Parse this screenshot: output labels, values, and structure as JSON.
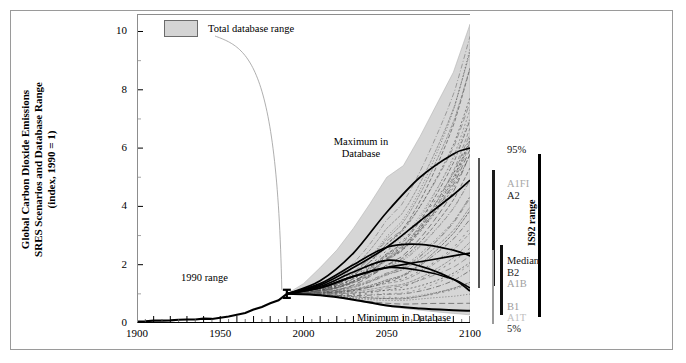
{
  "figure": {
    "ylabel_lines": [
      "Global Carbon Dioxide Emissions",
      "SRES Scenarios and Database Range",
      "(index, 1990 = 1)"
    ],
    "legend_label": "Total database range",
    "legend_swatch_color": "#d4d4d4"
  },
  "annotations": {
    "maximum": "Maximum in\nDatabase",
    "maximum_line1": "Maximum in",
    "maximum_line2": "Database",
    "minimum": "Minimum in Database",
    "range_1990": "1990 range"
  },
  "right_panel": {
    "isq_label": "IS92 range",
    "labels": [
      {
        "text": "95%",
        "color": "#111111",
        "x": 37,
        "y": 130
      },
      {
        "text": "A1FI",
        "color": "#a8a8a8",
        "x": 37,
        "y": 164
      },
      {
        "text": "A2",
        "color": "#222222",
        "x": 37,
        "y": 176
      },
      {
        "text": "Median",
        "color": "#111111",
        "x": 37,
        "y": 241
      },
      {
        "text": "B2",
        "color": "#222222",
        "x": 37,
        "y": 253
      },
      {
        "text": "A1B",
        "color": "#a0a0a0",
        "x": 37,
        "y": 264
      },
      {
        "text": "B1",
        "color": "#9a9a9a",
        "x": 37,
        "y": 287
      },
      {
        "text": "A1T",
        "color": "#c0c0c0",
        "x": 37,
        "y": 298
      },
      {
        "text": "5%",
        "color": "#222222",
        "x": 37,
        "y": 309
      }
    ],
    "bars": [
      {
        "name": "bar-sres-range",
        "x": 8,
        "y_top": 144,
        "y_bottom": 274,
        "color": "#555555",
        "width": 2
      },
      {
        "name": "bar-a1fi-a2",
        "x": 22,
        "y_top": 156,
        "y_bottom": 272,
        "color": "#1a1a1a",
        "width": 2.5
      },
      {
        "name": "bar-median-group",
        "x": 22,
        "y_top": 236,
        "y_bottom": 310,
        "color": "#9a9a9a",
        "width": 2
      },
      {
        "name": "bar-b1-a1t",
        "x": 30,
        "y_top": 231,
        "y_bottom": 301,
        "color": "#111111",
        "width": 2.5
      },
      {
        "name": "bar-is92",
        "x": 68,
        "y_top": 140,
        "y_bottom": 303,
        "color": "#000000",
        "width": 2.5
      }
    ]
  },
  "chart_data": {
    "type": "area",
    "title": "",
    "xlabel": "",
    "ylabel": "Global Carbon Dioxide Emissions SRES Scenarios and Database Range (index, 1990 = 1)",
    "xlim": [
      1900,
      2100
    ],
    "ylim": [
      0,
      10.6
    ],
    "xticks": [
      1900,
      1950,
      2000,
      2050,
      2100
    ],
    "yticks": [
      0,
      2,
      4,
      6,
      8,
      10
    ],
    "yticks_minor": [
      1,
      3,
      5,
      7,
      9
    ],
    "grid": false,
    "legend_position": "top-left",
    "series": [
      {
        "name": "Historical emissions",
        "style": "solid-thick-black",
        "x": [
          1900,
          1905,
          1910,
          1915,
          1920,
          1925,
          1930,
          1935,
          1940,
          1945,
          1950,
          1955,
          1960,
          1965,
          1970,
          1975,
          1980,
          1985,
          1990
        ],
        "values": [
          0.05,
          0.06,
          0.08,
          0.08,
          0.09,
          0.11,
          0.12,
          0.12,
          0.15,
          0.14,
          0.18,
          0.22,
          0.28,
          0.34,
          0.46,
          0.55,
          0.68,
          0.78,
          1.0
        ]
      },
      {
        "name": "Total database range - maximum",
        "style": "shaded-upper-bound",
        "x": [
          1990,
          2000,
          2010,
          2020,
          2030,
          2040,
          2050,
          2060,
          2070,
          2080,
          2090,
          2100
        ],
        "values": [
          1.0,
          1.35,
          1.9,
          2.5,
          3.25,
          4.1,
          5.0,
          5.4,
          6.4,
          7.5,
          8.6,
          10.25
        ]
      },
      {
        "name": "Total database range - minimum",
        "style": "shaded-lower-bound",
        "x": [
          1990,
          2000,
          2010,
          2020,
          2030,
          2040,
          2050,
          2060,
          2070,
          2080,
          2090,
          2100
        ],
        "values": [
          1.0,
          1.0,
          0.95,
          0.88,
          0.78,
          0.68,
          0.58,
          0.5,
          0.44,
          0.38,
          0.33,
          0.28
        ]
      },
      {
        "name": "A1FI",
        "style": "solid-black",
        "x": [
          1990,
          2010,
          2030,
          2050,
          2070,
          2090,
          2100
        ],
        "values": [
          1.0,
          1.45,
          2.4,
          3.8,
          5.0,
          5.8,
          6.0
        ]
      },
      {
        "name": "A2",
        "style": "solid-black",
        "x": [
          1990,
          2010,
          2030,
          2050,
          2070,
          2090,
          2100
        ],
        "values": [
          1.0,
          1.3,
          1.9,
          2.6,
          3.5,
          4.4,
          4.9
        ]
      },
      {
        "name": "A1B",
        "style": "solid-black",
        "x": [
          1990,
          2010,
          2030,
          2050,
          2070,
          2090,
          2100
        ],
        "values": [
          1.0,
          1.35,
          2.0,
          2.6,
          2.7,
          2.5,
          2.3
        ]
      },
      {
        "name": "B2",
        "style": "solid-black",
        "x": [
          1990,
          2010,
          2030,
          2050,
          2070,
          2090,
          2100
        ],
        "values": [
          1.0,
          1.2,
          1.6,
          1.9,
          2.1,
          2.3,
          2.4
        ]
      },
      {
        "name": "B1",
        "style": "solid-black",
        "x": [
          1990,
          2010,
          2030,
          2050,
          2070,
          2090,
          2100
        ],
        "values": [
          1.0,
          1.2,
          1.6,
          1.9,
          1.8,
          1.5,
          1.2
        ]
      },
      {
        "name": "A1T",
        "style": "solid-black",
        "x": [
          1990,
          2010,
          2030,
          2050,
          2070,
          2090,
          2100
        ],
        "values": [
          1.0,
          1.25,
          1.75,
          2.15,
          1.95,
          1.5,
          1.1
        ]
      },
      {
        "name": "Minimum in Database scenario",
        "style": "solid-thick-black",
        "x": [
          1990,
          2010,
          2030,
          2050,
          2070,
          2090,
          2100
        ],
        "values": [
          1.0,
          0.95,
          0.8,
          0.6,
          0.5,
          0.44,
          0.42
        ]
      }
    ],
    "marker_1990_range": {
      "x": 1990,
      "low": 0.86,
      "high": 1.14
    },
    "note": "Shaded band = total database range of published emission scenarios; thin dotted/dashed lines = individual database scenarios; bold lines = SRES marker scenarios."
  }
}
